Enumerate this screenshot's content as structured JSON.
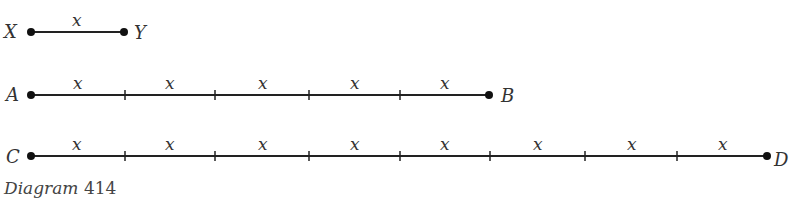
{
  "diagram": {
    "caption": {
      "word": "Diagram",
      "number": "414"
    },
    "segment_label": "x",
    "rows": [
      {
        "start": "X",
        "end": "Y",
        "segments": 1,
        "y": 32
      },
      {
        "start": "A",
        "end": "B",
        "segments": 5,
        "y": 95
      },
      {
        "start": "C",
        "end": "D",
        "segments": 8,
        "y": 156
      }
    ],
    "line_color": "#222222"
  }
}
